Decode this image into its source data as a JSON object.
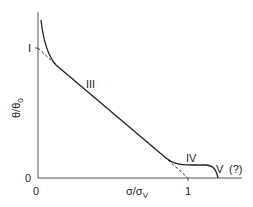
{
  "diagram": {
    "y_axis_label": "θ/θ",
    "y_axis_label_sub": "0",
    "x_axis_label": "σ/σ",
    "x_axis_label_sub": "V",
    "y_tick_zero": "0",
    "y_tick_one": "I",
    "x_tick_zero": "0",
    "x_tick_one": "1",
    "stage_labels": {
      "stage_III": "III",
      "stage_IV": "IV",
      "stage_V": "V",
      "stage_V_note": "(?)"
    },
    "colors": {
      "line": "#222222",
      "axis": "#555555"
    }
  }
}
